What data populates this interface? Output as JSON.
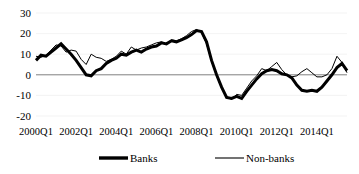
{
  "chart_data": {
    "type": "line",
    "title": "",
    "subtitle": "",
    "xlabel": "",
    "ylabel": "",
    "ylim": [
      -20,
      30
    ],
    "yticks": [
      30,
      20,
      10,
      0,
      -10,
      -20
    ],
    "ytick_labels": [
      "30",
      "20",
      "10",
      "0",
      "-10",
      "-20"
    ],
    "grid": true,
    "grid_axis": "y",
    "zero_line": true,
    "legend_position": "bottom",
    "x_tick_labels": [
      "2000Q1",
      "2002Q1",
      "2004Q1",
      "2006Q1",
      "2008Q1",
      "2010Q1",
      "2012Q1",
      "2014Q1"
    ],
    "x_tick_indices": [
      0,
      8,
      16,
      24,
      32,
      40,
      48,
      56
    ],
    "x": [
      "2000Q1",
      "2000Q2",
      "2000Q3",
      "2000Q4",
      "2001Q1",
      "2001Q2",
      "2001Q3",
      "2001Q4",
      "2002Q1",
      "2002Q2",
      "2002Q3",
      "2002Q4",
      "2003Q1",
      "2003Q2",
      "2003Q3",
      "2003Q4",
      "2004Q1",
      "2004Q2",
      "2004Q3",
      "2004Q4",
      "2005Q1",
      "2005Q2",
      "2005Q3",
      "2005Q4",
      "2006Q1",
      "2006Q2",
      "2006Q3",
      "2006Q4",
      "2007Q1",
      "2007Q2",
      "2007Q3",
      "2007Q4",
      "2008Q1",
      "2008Q2",
      "2008Q3",
      "2008Q4",
      "2009Q1",
      "2009Q2",
      "2009Q3",
      "2009Q4",
      "2010Q1",
      "2010Q2",
      "2010Q3",
      "2010Q4",
      "2011Q1",
      "2011Q2",
      "2011Q3",
      "2011Q4",
      "2012Q1",
      "2012Q2",
      "2012Q3",
      "2012Q4",
      "2013Q1",
      "2013Q2",
      "2013Q3",
      "2013Q4",
      "2014Q1",
      "2014Q2",
      "2014Q3",
      "2014Q4",
      "2015Q1",
      "2015Q2",
      "2015Q3"
    ],
    "series": [
      {
        "name": "Banks",
        "color": "#000000",
        "line_width": 3,
        "values": [
          7.0,
          9.5,
          9.0,
          11.0,
          13.0,
          15.0,
          12.5,
          10.0,
          7.0,
          3.5,
          0.0,
          -0.5,
          2.0,
          3.0,
          5.5,
          7.0,
          8.0,
          10.0,
          9.5,
          11.0,
          12.0,
          11.0,
          12.5,
          13.5,
          14.0,
          15.5,
          15.0,
          16.5,
          16.0,
          17.0,
          18.0,
          19.5,
          21.5,
          21.0,
          16.0,
          7.0,
          0.0,
          -6.0,
          -11.0,
          -11.5,
          -10.5,
          -11.5,
          -8.0,
          -5.0,
          -2.0,
          0.5,
          2.0,
          2.5,
          2.0,
          0.5,
          0.0,
          -1.5,
          -5.0,
          -7.5,
          -8.0,
          -7.5,
          -8.0,
          -6.0,
          -3.0,
          0.0,
          3.5,
          5.5,
          2.0
        ]
      },
      {
        "name": "Non-banks",
        "color": "#000000",
        "line_width": 1,
        "values": [
          9.0,
          8.5,
          9.5,
          12.0,
          14.5,
          14.0,
          11.0,
          12.0,
          11.5,
          7.5,
          5.0,
          10.0,
          8.5,
          8.0,
          6.5,
          7.5,
          9.0,
          11.5,
          10.0,
          13.5,
          12.0,
          13.0,
          13.5,
          14.5,
          15.5,
          16.0,
          15.0,
          17.0,
          16.5,
          17.5,
          19.0,
          21.0,
          22.0,
          20.5,
          15.0,
          6.5,
          -0.5,
          -6.5,
          -10.5,
          -12.0,
          -9.5,
          -10.0,
          -6.5,
          -3.0,
          -0.5,
          3.0,
          2.0,
          4.0,
          6.0,
          2.5,
          0.0,
          -1.0,
          -0.5,
          1.5,
          3.0,
          1.0,
          -1.0,
          -1.0,
          0.0,
          3.0,
          9.0,
          6.0,
          1.0
        ]
      }
    ],
    "legend": [
      {
        "label": "Banks",
        "style": "thick"
      },
      {
        "label": "Non-banks",
        "style": "thin"
      }
    ]
  },
  "geometry": {
    "plot_left": 36,
    "plot_right": 347,
    "plot_top": 13,
    "plot_bottom": 116,
    "legend_y": 158
  }
}
